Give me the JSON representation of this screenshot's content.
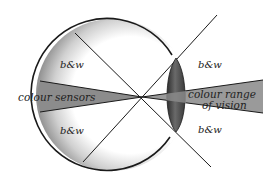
{
  "diagram": {
    "labels": {
      "bw_upper_left": "b&w",
      "bw_lower_left": "b&w",
      "bw_upper_right": "b&w",
      "bw_lower_right": "b&w",
      "colour_sensors": "colour sensors",
      "colour_range_line1": "colour range",
      "colour_range_line2": "of vision"
    },
    "colors": {
      "outline": "#1a1a1a",
      "sensor_wedge": "#8a8a8a",
      "vision_cone": "#9a9a9a",
      "lens": "#555555",
      "retina_shade": "#9c9c9c",
      "background": "#ffffff"
    }
  }
}
